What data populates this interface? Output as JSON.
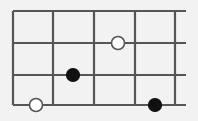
{
  "figure": {
    "title": "",
    "type": "lattice-diagram",
    "canvas": {
      "width": 198,
      "height": 121
    },
    "background_color": "#f2f2f2",
    "line_color": "#555555",
    "line_width": 2.2
  },
  "grid": {
    "columns": 4,
    "rows": 3,
    "vertical_line_x": [
      13,
      53,
      94,
      135,
      175
    ],
    "horizontal_line_y": [
      11,
      43,
      75,
      105
    ],
    "horizontal_overhang_right": 11,
    "vertical_extent": {
      "top": 11,
      "bottom": 105
    },
    "horizontal_extent": {
      "left": 13,
      "right": 186
    }
  },
  "markers": [
    {
      "name": "open-circle-top",
      "style": "open",
      "cx": 118,
      "cy": 43,
      "r": 6.5,
      "fill_color": "#ffffff",
      "stroke_color": "#555555",
      "grid_position": {
        "col": 2.6,
        "row": 1
      }
    },
    {
      "name": "filled-circle-middle",
      "style": "filled",
      "cx": 73,
      "cy": 75,
      "r": 6.5,
      "fill_color": "#111111",
      "stroke_color": "#111111",
      "grid_position": {
        "col": 1.5,
        "row": 2
      }
    },
    {
      "name": "open-circle-bottom-left",
      "style": "open",
      "cx": 36,
      "cy": 105,
      "r": 6.5,
      "fill_color": "#ffffff",
      "stroke_color": "#555555",
      "grid_position": {
        "col": 0.6,
        "row": 3
      }
    },
    {
      "name": "filled-circle-bottom-right",
      "style": "filled",
      "cx": 155,
      "cy": 105,
      "r": 6.5,
      "fill_color": "#111111",
      "stroke_color": "#111111",
      "grid_position": {
        "col": 3.5,
        "row": 3
      }
    }
  ],
  "chart_data": {
    "type": "scatter",
    "title": "",
    "xlabel": "",
    "ylabel": "",
    "xlim": [
      13,
      186
    ],
    "ylim": [
      11,
      105
    ],
    "grid": true,
    "legend": "none",
    "series": [
      {
        "name": "open circles",
        "marker": "open",
        "points": [
          {
            "x": 118,
            "y": 43
          },
          {
            "x": 36,
            "y": 105
          }
        ]
      },
      {
        "name": "filled circles",
        "marker": "filled",
        "points": [
          {
            "x": 73,
            "y": 75
          },
          {
            "x": 155,
            "y": 105
          }
        ]
      }
    ]
  }
}
